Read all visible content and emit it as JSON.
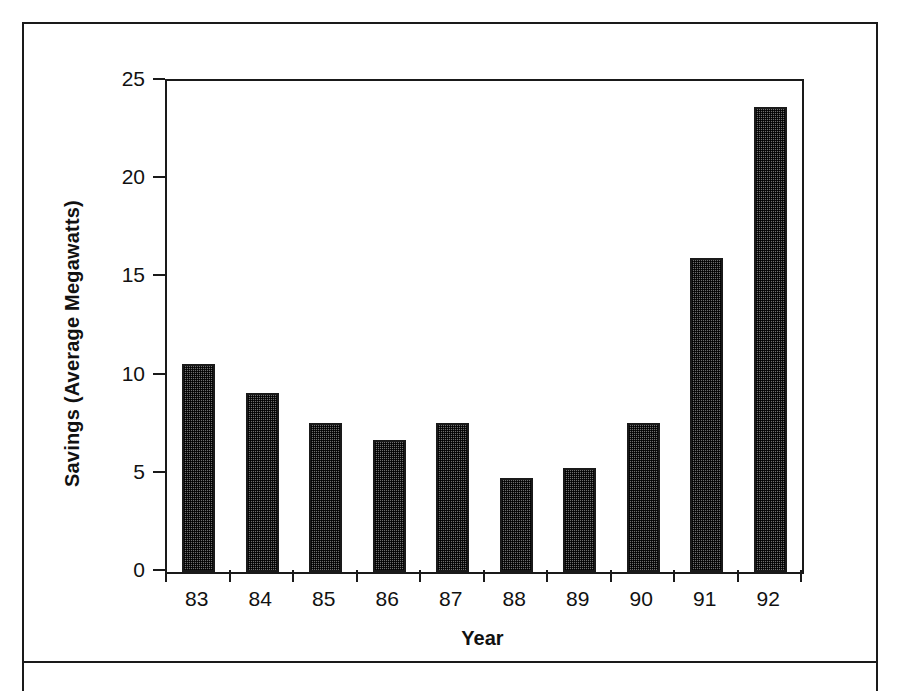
{
  "chart_data": {
    "type": "bar",
    "title": "",
    "subtitle": "",
    "xlabel": "Year",
    "ylabel": "Savings (Average Megawatts)",
    "categories": [
      "83",
      "84",
      "85",
      "86",
      "87",
      "88",
      "89",
      "90",
      "91",
      "92"
    ],
    "values": [
      10.6,
      9.1,
      7.6,
      6.7,
      7.6,
      4.8,
      5.3,
      7.6,
      16.0,
      23.7
    ],
    "series": [
      {
        "name": "Savings",
        "values": [
          10.6,
          9.1,
          7.6,
          6.7,
          7.6,
          4.8,
          5.3,
          7.6,
          16.0,
          23.7
        ]
      }
    ],
    "ylim": [
      0,
      25
    ],
    "yticks": [
      0,
      5,
      10,
      15,
      20,
      25
    ],
    "ytick_labels": [
      "0",
      "5",
      "10",
      "15",
      "20",
      "25"
    ],
    "xtick_labels": [
      "83",
      "84",
      "85",
      "86",
      "87",
      "88",
      "89",
      "90",
      "91",
      "92"
    ],
    "grid": false,
    "legend": false,
    "legend_position": "none",
    "bar_fill": "#6e6e6e",
    "bar_edge": "#1a1a1a",
    "axis_color": "#1a1a1a",
    "background": "#ffffff"
  }
}
